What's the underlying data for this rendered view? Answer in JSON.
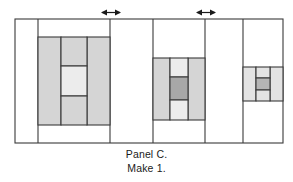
{
  "figure": {
    "title_line1": "Panel C.",
    "title_line2": "Make 1.",
    "colors": {
      "outline": "#3a3a3a",
      "background": "#ffffff",
      "block_medium": "#d5d5d5",
      "block_light": "#ececec",
      "block_dark": "#a8a8a8",
      "block_pale": "#e3e3e3",
      "text": "#1a1a1a"
    },
    "panel_rect": {
      "x": 15,
      "y": 19,
      "w": 268,
      "h": 124
    },
    "vertical_seams": [
      38,
      110,
      153,
      205,
      243
    ],
    "arrows": [
      {
        "name": "seam-arrow-left",
        "x": 111,
        "y": 12,
        "width": 22
      },
      {
        "name": "seam-arrow-right",
        "x": 206,
        "y": 12,
        "width": 22
      }
    ],
    "blocks": [
      {
        "name": "large-nine-patch-block",
        "outer": {
          "x": 38,
          "y": 37,
          "w": 72,
          "h": 88
        },
        "side_bars": [
          {
            "x": 38,
            "y": 37,
            "w": 23,
            "h": 88
          },
          {
            "x": 87,
            "y": 37,
            "w": 23,
            "h": 88
          }
        ],
        "center_column": {
          "x": 61,
          "y": 37,
          "w": 26,
          "h": 88
        },
        "center_square": {
          "x": 61,
          "y": 66,
          "w": 26,
          "h": 30
        }
      },
      {
        "name": "medium-nine-patch-block",
        "outer": {
          "x": 153,
          "y": 58,
          "w": 52,
          "h": 62
        },
        "side_bars": [
          {
            "x": 153,
            "y": 58,
            "w": 17,
            "h": 62
          },
          {
            "x": 188,
            "y": 58,
            "w": 17,
            "h": 62
          }
        ],
        "center_column": {
          "x": 170,
          "y": 58,
          "w": 18,
          "h": 62
        },
        "center_square": {
          "x": 170,
          "y": 77,
          "w": 18,
          "h": 23
        }
      },
      {
        "name": "small-nine-patch-block",
        "outer": {
          "x": 243,
          "y": 67,
          "w": 40,
          "h": 34
        },
        "side_bars": [
          {
            "x": 243,
            "y": 67,
            "w": 13,
            "h": 34
          },
          {
            "x": 270,
            "y": 67,
            "w": 13,
            "h": 34
          }
        ],
        "center_column": {
          "x": 256,
          "y": 67,
          "w": 14,
          "h": 34
        },
        "center_square": {
          "x": 256,
          "y": 78,
          "w": 14,
          "h": 12
        }
      }
    ]
  }
}
